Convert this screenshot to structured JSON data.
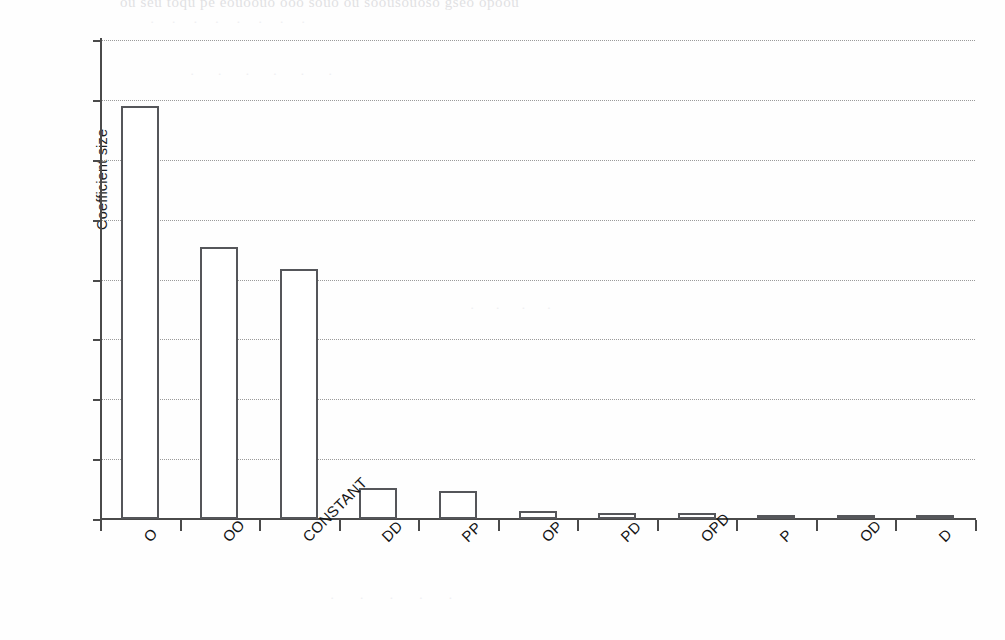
{
  "chart_data": {
    "type": "bar",
    "title": "",
    "subtitle": "",
    "xlabel": "",
    "ylabel": "Coefficient size",
    "ylim": [
      0,
      4
    ],
    "ytick_values": [
      0,
      0.5,
      1,
      1.5,
      2,
      2.5,
      3,
      3.5,
      4
    ],
    "ytick_labels": [
      "0",
      "0.5",
      "1",
      "1.5",
      "2",
      "2.5",
      "3",
      "3.5",
      "4"
    ],
    "grid": "horizontal-dotted",
    "legend": null,
    "legend_position": "none",
    "bar_fill_color": "#ffffff",
    "bar_edge_color": "#55565a",
    "axis_color": "#4a4a4a",
    "gridline_color": "#9a9a9a",
    "categories": [
      "O",
      "OO",
      "CONSTANT",
      "DD",
      "PP",
      "OP",
      "PD",
      "OPD",
      "P",
      "OD",
      "D"
    ],
    "values": [
      3.45,
      2.27,
      2.09,
      0.26,
      0.23,
      0.065,
      0.05,
      0.05,
      0.03,
      0.015,
      0.005
    ],
    "xlabel_rotation": -45
  },
  "scan_artifacts": {
    "top_bleed": "ou seu toqu pe eouoouo ooo souo ou soousouoso gseo opoou",
    "faint_a": "· · · · · · · ·",
    "faint_b": "· · · · · ·",
    "faint_c": "· · · ·",
    "faint_d": "· · · · ·"
  }
}
